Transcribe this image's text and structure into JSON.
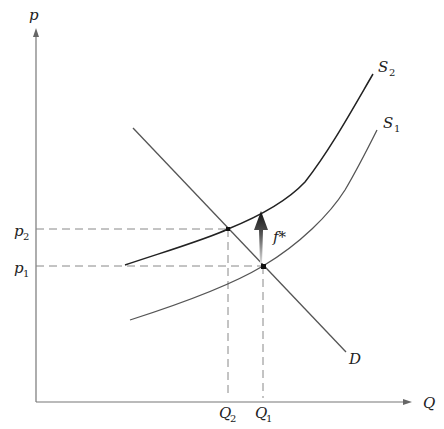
{
  "diagram": {
    "type": "supply-demand",
    "axes": {
      "y_label": "p",
      "x_label": "Q"
    },
    "curves": [
      {
        "id": "S2",
        "label": "S",
        "sub": "2",
        "kind": "supply",
        "color": "#222222"
      },
      {
        "id": "S1",
        "label": "S",
        "sub": "1",
        "kind": "supply",
        "color": "#555555"
      },
      {
        "id": "D",
        "label": "D",
        "kind": "demand",
        "color": "#555555"
      }
    ],
    "price_levels": [
      {
        "label": "p",
        "sub": "2"
      },
      {
        "label": "p",
        "sub": "1"
      }
    ],
    "quantity_levels": [
      {
        "label": "Q",
        "sub": "2"
      },
      {
        "label": "Q",
        "sub": "1"
      }
    ],
    "shift_arrow": {
      "label": "f*"
    },
    "equilibria": [
      {
        "name": "new",
        "price": "p2",
        "quantity": "Q2"
      },
      {
        "name": "original",
        "price": "p1",
        "quantity": "Q1"
      }
    ]
  }
}
